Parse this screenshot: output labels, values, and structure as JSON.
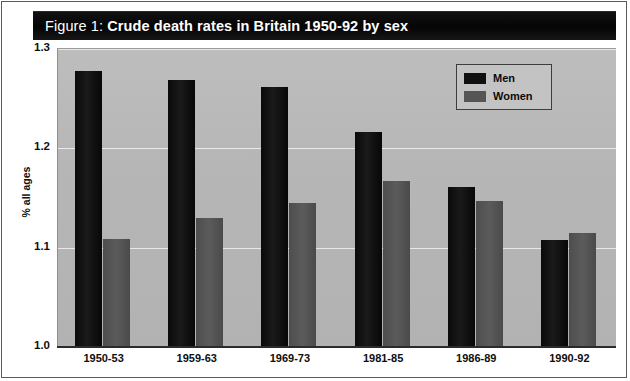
{
  "figure": {
    "title_label": "Figure 1:",
    "title_main": "Crude death rates in Britain 1950-92 by sex"
  },
  "colors": {
    "title_bar": "#0d0d0d",
    "plot_background": "#b9b9b9",
    "men_bar": "#111111",
    "women_bar": "#565656",
    "gridline": "#ecebe9",
    "axis": "#2b2b2b"
  },
  "chart_data": {
    "type": "bar",
    "title": "Figure 1: Crude death rates in Britain 1950-92 by sex",
    "xlabel": "",
    "ylabel": "% all ages",
    "ylim": [
      1.0,
      1.3
    ],
    "yticks": [
      "1.0",
      "1.1",
      "1.2",
      "1.3"
    ],
    "ytick_values": [
      1.0,
      1.1,
      1.2,
      1.3
    ],
    "grid": true,
    "legend_position": "top-right",
    "categories": [
      "1950-53",
      "1959-63",
      "1969-73",
      "1981-85",
      "1986-89",
      "1990-92"
    ],
    "series": [
      {
        "name": "Men",
        "color": "#111111",
        "values": [
          1.277,
          1.268,
          1.261,
          1.215,
          1.16,
          1.107
        ]
      },
      {
        "name": "Women",
        "color": "#565656",
        "values": [
          1.108,
          1.129,
          1.144,
          1.166,
          1.146,
          1.114
        ]
      }
    ]
  }
}
